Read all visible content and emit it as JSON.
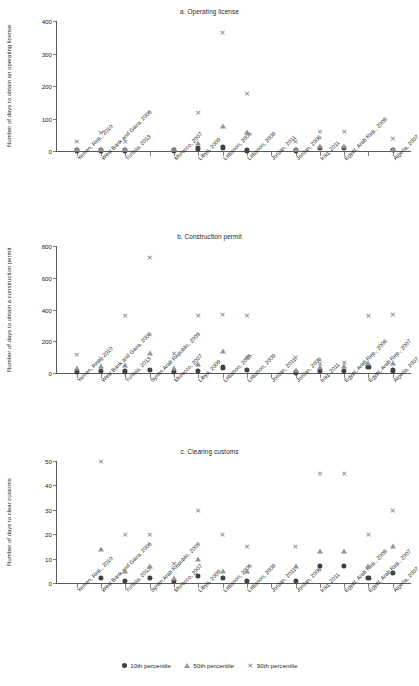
{
  "figure": {
    "legend": [
      {
        "marker": "circle-marker",
        "label": "10th percentile",
        "color": "#414042"
      },
      {
        "marker": "triangle-marker",
        "label": "50th percentile",
        "color": "#939598"
      },
      {
        "marker": "cross-marker",
        "label": "90th percentile",
        "color": "#6d6e71"
      }
    ]
  },
  "chart_data": [
    {
      "type": "scatter",
      "title": "a. Operating license",
      "xlabel": "",
      "ylabel": "Number of days to obtain an operating license",
      "ylim": [
        0,
        400
      ],
      "yticks": [
        0,
        100,
        200,
        300,
        400
      ],
      "grid": false,
      "legend_position": "bottom",
      "categories": [
        "Yemen, Rep., 2010",
        "West Bank and Gaza, 2006",
        "Tunisia, 2013",
        "",
        "Morocco, 2007",
        "Libya, 2009",
        "Lebanon, 2006",
        "Lebanon, 2009",
        "Jordan, 2011",
        "Jordan, 2006",
        "Iraq, 2011",
        "Egypt, Arab Rep., 2008",
        "",
        "Algeria, 2007"
      ],
      "series": [
        {
          "name": "10th percentile",
          "values": [
            2,
            2,
            2,
            null,
            2,
            8,
            11,
            2,
            null,
            2,
            10,
            10,
            null,
            3
          ]
        },
        {
          "name": "50th percentile",
          "values": [
            6,
            6,
            5,
            null,
            5,
            25,
            77,
            60,
            null,
            5,
            15,
            15,
            null,
            7
          ]
        },
        {
          "name": "90th percentile",
          "values": [
            30,
            60,
            30,
            null,
            6,
            120,
            365,
            180,
            null,
            32,
            62,
            61,
            null,
            40
          ]
        }
      ]
    },
    {
      "type": "scatter",
      "title": "b. Construction permit",
      "xlabel": "",
      "ylabel": "Number of days to obtain a construction permit",
      "ylim": [
        0,
        800
      ],
      "yticks": [
        0,
        200,
        400,
        600,
        800
      ],
      "grid": false,
      "legend_position": "bottom",
      "categories": [
        "Yemen, Rep., 2010",
        "West Bank and Gaza, 2006",
        "Tunisia, 2013",
        "Syrian Arab Republic, 2009",
        "Morocco, 2007",
        "Libya, 2009",
        "Lebanon, 2006",
        "Lebanon, 2009",
        "Jordan, 2011",
        "Jordan, 2006",
        "Iraq, 2011",
        "Egypt, Arab Rep., 2008",
        "Egypt, Arab Rep., 2007",
        "Algeria, 2007"
      ],
      "series": [
        {
          "name": "10th percentile",
          "values": [
            5,
            13,
            10,
            20,
            7,
            12,
            35,
            19,
            null,
            4,
            15,
            14,
            38,
            16
          ]
        },
        {
          "name": "50th percentile",
          "values": [
            30,
            45,
            50,
            125,
            30,
            58,
            140,
            98,
            null,
            18,
            40,
            45,
            60,
            62
          ]
        },
        {
          "name": "90th percentile",
          "values": [
            122,
            95,
            368,
            730,
            125,
            363,
            370,
            367,
            null,
            100,
            60,
            70,
            366,
            370
          ]
        }
      ]
    },
    {
      "type": "scatter",
      "title": "c. Clearing customs",
      "xlabel": "",
      "ylabel": "Number of days to clear customs",
      "ylim": [
        0,
        50
      ],
      "yticks": [
        0,
        10,
        20,
        30,
        40,
        50
      ],
      "grid": false,
      "legend_position": "bottom",
      "categories": [
        "Yemen, Rep., 2010",
        "West Bank and Gaza, 2006",
        "Tunisia, 2013",
        "Syrian Arab Republic, 2009",
        "Morocco, 2007",
        "Libya, 2009",
        "Lebanon, 2006",
        "Lebanon, 2009",
        "Jordan, 2011",
        "Jordan, 2006",
        "Iraq, 2011",
        "Egypt, Arab Rep., 2008",
        "Egypt, Arab Rep., 2007",
        "Algeria, 2007"
      ],
      "series": [
        {
          "name": "10th percentile",
          "values": [
            null,
            2,
            1,
            2,
            1,
            3,
            2,
            1,
            null,
            1,
            7,
            7,
            2,
            4
          ]
        },
        {
          "name": "50th percentile",
          "values": [
            null,
            14,
            5,
            7,
            2,
            10,
            5,
            5,
            null,
            7,
            13,
            13,
            7,
            15
          ]
        },
        {
          "name": "90th percentile",
          "values": [
            null,
            50,
            20,
            20,
            8,
            30,
            20,
            15,
            null,
            15,
            45,
            45,
            20,
            30
          ]
        }
      ]
    }
  ]
}
